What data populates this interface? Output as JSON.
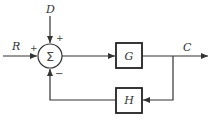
{
  "diagram": {
    "type": "feedback-control-block-diagram",
    "inputs": {
      "reference": "R",
      "disturbance": "D"
    },
    "output": "C",
    "summing_junction": {
      "symbol": "Σ",
      "signs": {
        "reference": "+",
        "disturbance": "+",
        "feedback": "−"
      }
    },
    "blocks": {
      "forward": "G",
      "feedback": "H"
    },
    "colors": {
      "line": "#333333",
      "block_border": "#222222",
      "background": "#ffffff"
    }
  }
}
